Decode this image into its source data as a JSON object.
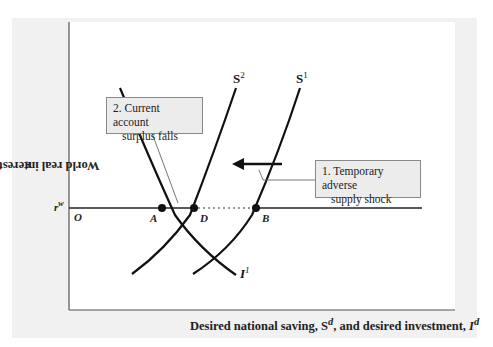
{
  "figure": {
    "y_axis_label": "World real interest rate, r",
    "y_axis_label_sup": "w",
    "x_axis_label_pre": "Desired national saving, ",
    "x_axis_sd": "S",
    "x_axis_sd_sup": "d",
    "x_axis_label_mid": ", and desired investment, ",
    "x_axis_id": "I",
    "x_axis_id_sup": "d",
    "rw_label": "r",
    "rw_label_sup": "w",
    "origin_label": "O",
    "points": {
      "A": "A",
      "D": "D",
      "B": "B"
    },
    "curves": {
      "S1": {
        "name": "S",
        "sup": "1"
      },
      "S2": {
        "name": "S",
        "sup": "2"
      },
      "I1": {
        "name": "I",
        "sup": "1"
      }
    },
    "callouts": {
      "shock_line1": "1. Temporary adverse",
      "shock_line2": "supply shock",
      "ca_line1": "2. Current account",
      "ca_line2": "surplus falls"
    },
    "colors": {
      "curve": "#111111",
      "panel": "#f1f1f1",
      "callout_bg": "#ececec"
    }
  }
}
